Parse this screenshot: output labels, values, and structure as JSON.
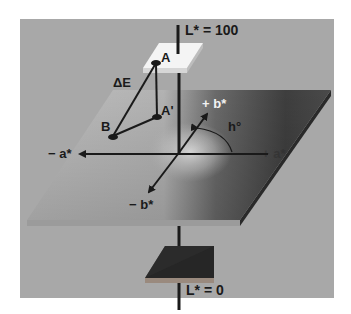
{
  "diagram": {
    "type": "CIELAB color space illustration",
    "labels": {
      "l_top": "L* = 100",
      "l_bottom": "L* = 0",
      "point_a": "A",
      "point_a_prime": "A'",
      "point_b": "B",
      "delta_e": "ΔE",
      "plus_b": "+ b*",
      "minus_b": "− b*",
      "minus_a": "− a*",
      "plus_a": "+ a*",
      "hue": "h°"
    },
    "colors": {
      "background": "#ffffff",
      "panel": "#a9a9a9",
      "plane_light": "#c4c4c4",
      "plane_dark": "#3a3a3a",
      "top_plate": "#f4f4f4",
      "bottom_plate": "#262626",
      "lines": "#1a1a1a"
    }
  }
}
